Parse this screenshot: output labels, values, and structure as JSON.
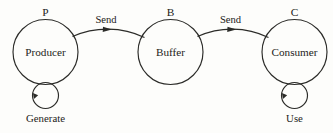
{
  "diagram": {
    "background_color": "#fdfdfb",
    "ink_color": "#2b2b28",
    "nodes": [
      {
        "id": "producer",
        "tag": "P",
        "label": "Producer",
        "cx": 45.5,
        "cy": 52,
        "r": 32.5,
        "self_loop": {
          "label": "Generate",
          "cx": 45.5,
          "cy": 95.5,
          "r": 13
        }
      },
      {
        "id": "buffer",
        "tag": "B",
        "label": "Buffer",
        "cx": 170.5,
        "cy": 52,
        "r": 32.5,
        "self_loop": null
      },
      {
        "id": "consumer",
        "tag": "C",
        "label": "Consumer",
        "cx": 294.5,
        "cy": 52,
        "r": 32.5,
        "self_loop": {
          "label": "Use",
          "cx": 294.5,
          "cy": 95.5,
          "r": 13
        }
      }
    ],
    "edges": [
      {
        "id": "producer-to-buffer",
        "label": "Send",
        "from": "producer",
        "to": "buffer"
      },
      {
        "id": "buffer-to-consumer",
        "label": "Send",
        "from": "buffer",
        "to": "consumer"
      }
    ]
  }
}
